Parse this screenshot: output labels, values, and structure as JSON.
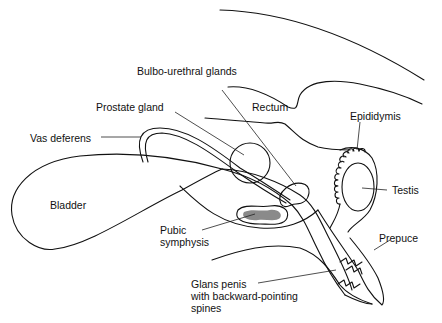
{
  "diagram": {
    "labels": [
      {
        "id": "bulbo-urethral-glands",
        "text": "Bulbo-urethral glands"
      },
      {
        "id": "prostate-gland",
        "text": "Prostate gland"
      },
      {
        "id": "rectum",
        "text": "Rectum"
      },
      {
        "id": "epididymis",
        "text": "Epididymis"
      },
      {
        "id": "vas-deferens",
        "text": "Vas deferens"
      },
      {
        "id": "testis",
        "text": "Testis"
      },
      {
        "id": "bladder",
        "text": "Bladder"
      },
      {
        "id": "pubic-symphysis-1",
        "text": "Pubic"
      },
      {
        "id": "pubic-symphysis-2",
        "text": "symphysis"
      },
      {
        "id": "prepuce",
        "text": "Prepuce"
      },
      {
        "id": "glans-1",
        "text": "Glans penis"
      },
      {
        "id": "glans-2",
        "text": "with backward-pointing"
      },
      {
        "id": "glans-3",
        "text": "spines"
      }
    ],
    "colors": {
      "line": "#111111",
      "bone_fill": "#8a8a8a",
      "background": "#ffffff"
    }
  }
}
